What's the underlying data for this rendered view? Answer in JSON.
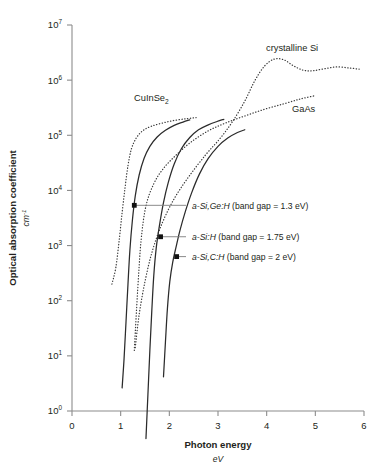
{
  "chart_data": {
    "type": "line",
    "title": "",
    "xlabel": "Photon energy",
    "xunit": "eV",
    "ylabel": "Optical absorption coefficient",
    "yunit": "cm",
    "yunit_exponent": "-1",
    "xlim": [
      0,
      6
    ],
    "ylim_log10": [
      0,
      7
    ],
    "xticks": [
      "0",
      "1",
      "2",
      "3",
      "4",
      "5",
      "6"
    ],
    "xtick_values": [
      0,
      1,
      2,
      3,
      4,
      5,
      6
    ],
    "yticks": [
      "10",
      "10",
      "10",
      "10",
      "10",
      "10",
      "10",
      "10"
    ],
    "ytick_exponents": [
      "0",
      "1",
      "2",
      "3",
      "4",
      "5",
      "6",
      "7"
    ],
    "ytick_values": [
      1,
      10,
      100,
      1000,
      10000,
      100000,
      1000000,
      10000000
    ],
    "grid": false,
    "legend_position": "inline-curve-labels",
    "series": [
      {
        "name": "CuInSe2",
        "label": "CuInSe",
        "label_sub": "2",
        "style": "dotted",
        "points": [
          [
            0.82,
            2.3
          ],
          [
            0.9,
            2.6
          ],
          [
            0.97,
            3.1
          ],
          [
            1.03,
            3.6
          ],
          [
            1.09,
            4.05
          ],
          [
            1.15,
            4.45
          ],
          [
            1.22,
            4.75
          ],
          [
            1.32,
            4.95
          ],
          [
            1.45,
            5.08
          ],
          [
            1.62,
            5.16
          ],
          [
            1.85,
            5.22
          ],
          [
            2.1,
            5.27
          ],
          [
            2.35,
            5.3
          ],
          [
            2.55,
            5.32
          ]
        ]
      },
      {
        "name": "crystalline Si",
        "label": "crystalline Si",
        "style": "dotted",
        "points": [
          [
            1.3,
            1.15
          ],
          [
            1.38,
            1.75
          ],
          [
            1.5,
            2.35
          ],
          [
            1.65,
            2.9
          ],
          [
            1.85,
            3.4
          ],
          [
            2.1,
            3.85
          ],
          [
            2.4,
            4.25
          ],
          [
            2.75,
            4.65
          ],
          [
            3.05,
            4.95
          ],
          [
            3.3,
            5.25
          ],
          [
            3.55,
            5.62
          ],
          [
            3.75,
            5.98
          ],
          [
            3.95,
            6.25
          ],
          [
            4.15,
            6.38
          ],
          [
            4.35,
            6.37
          ],
          [
            4.55,
            6.26
          ],
          [
            4.75,
            6.18
          ],
          [
            4.95,
            6.17
          ],
          [
            5.2,
            6.21
          ],
          [
            5.45,
            6.24
          ],
          [
            5.7,
            6.22
          ],
          [
            5.9,
            6.2
          ]
        ]
      },
      {
        "name": "GaAs",
        "label": "GaAs",
        "style": "dotted",
        "points": [
          [
            1.28,
            1.1
          ],
          [
            1.35,
            2.2
          ],
          [
            1.42,
            3.1
          ],
          [
            1.52,
            3.72
          ],
          [
            1.68,
            4.12
          ],
          [
            1.88,
            4.4
          ],
          [
            2.15,
            4.65
          ],
          [
            2.45,
            4.88
          ],
          [
            2.8,
            5.08
          ],
          [
            3.15,
            5.22
          ],
          [
            3.55,
            5.35
          ],
          [
            3.95,
            5.47
          ],
          [
            4.35,
            5.57
          ],
          [
            4.7,
            5.66
          ],
          [
            5.0,
            5.72
          ]
        ]
      },
      {
        "name": "a-Si,Ge:H",
        "band_gap_eV": 1.3,
        "annotation": "a-Si,Ge:H (band gap = 1.3 eV)",
        "style": "solid",
        "marker_point": [
          1.28,
          3.73
        ],
        "points": [
          [
            1.03,
            0.42
          ],
          [
            1.07,
            0.95
          ],
          [
            1.11,
            1.62
          ],
          [
            1.15,
            2.3
          ],
          [
            1.19,
            2.92
          ],
          [
            1.24,
            3.45
          ],
          [
            1.3,
            3.9
          ],
          [
            1.38,
            4.28
          ],
          [
            1.48,
            4.58
          ],
          [
            1.6,
            4.8
          ],
          [
            1.75,
            4.97
          ],
          [
            1.92,
            5.09
          ],
          [
            2.1,
            5.18
          ],
          [
            2.28,
            5.24
          ],
          [
            2.42,
            5.28
          ]
        ]
      },
      {
        "name": "a-Si:H",
        "band_gap_eV": 1.75,
        "annotation": "a-Si:H (band gap = 1.75 eV)",
        "style": "solid",
        "marker_point": [
          1.82,
          3.16
        ],
        "points": [
          [
            1.52,
            -0.5
          ],
          [
            1.56,
            0.3
          ],
          [
            1.6,
            1.1
          ],
          [
            1.64,
            1.82
          ],
          [
            1.68,
            2.45
          ],
          [
            1.73,
            2.95
          ],
          [
            1.8,
            3.38
          ],
          [
            1.88,
            3.78
          ],
          [
            1.98,
            4.15
          ],
          [
            2.1,
            4.48
          ],
          [
            2.25,
            4.76
          ],
          [
            2.42,
            4.96
          ],
          [
            2.6,
            5.1
          ],
          [
            2.8,
            5.19
          ],
          [
            2.98,
            5.25
          ],
          [
            3.12,
            5.29
          ]
        ]
      },
      {
        "name": "a-Si,C:H",
        "band_gap_eV": 2,
        "annotation": "a-Si,C:H (band gap = 2 eV)",
        "style": "solid",
        "marker_point": [
          2.15,
          2.8
        ],
        "points": [
          [
            1.88,
            0.62
          ],
          [
            1.92,
            1.25
          ],
          [
            1.96,
            1.85
          ],
          [
            2.01,
            2.35
          ],
          [
            2.07,
            2.7
          ],
          [
            2.14,
            2.98
          ],
          [
            2.22,
            3.28
          ],
          [
            2.33,
            3.62
          ],
          [
            2.46,
            3.96
          ],
          [
            2.62,
            4.3
          ],
          [
            2.8,
            4.58
          ],
          [
            3.0,
            4.8
          ],
          [
            3.2,
            4.95
          ],
          [
            3.4,
            5.05
          ],
          [
            3.55,
            5.1
          ]
        ]
      }
    ],
    "annotations": [
      {
        "text": "a-Si,Ge:H (band gap = 1.3 eV)",
        "italic_prefix": "a-Si,Ge:H",
        "rest": " (band gap = 1.3 eV)",
        "marker_x": 1.28,
        "marker_y_log10": 3.73
      },
      {
        "text": "a-Si:H (band gap = 1.75 eV)",
        "italic_prefix": "a-Si:H",
        "rest": " (band gap = 1.75 eV)",
        "marker_x": 1.82,
        "marker_y_log10": 3.16
      },
      {
        "text": "a-Si,C:H (band gap = 2 eV)",
        "italic_prefix": "a-Si,C:H",
        "rest": " (band gap = 2 eV)",
        "marker_x": 2.15,
        "marker_y_log10": 2.8
      }
    ],
    "curve_labels": [
      {
        "name": "CuInSe2",
        "text": "CuInSe",
        "sub": "2"
      },
      {
        "name": "crystalline Si",
        "text": "crystalline Si",
        "sub": ""
      },
      {
        "name": "GaAs",
        "text": "GaAs",
        "sub": ""
      }
    ],
    "colors": {
      "axis": "#8c8c8c",
      "curve": "#2b2b2b",
      "text": "#231f20",
      "leader": "#7d7d7d",
      "background": "#ffffff"
    }
  }
}
